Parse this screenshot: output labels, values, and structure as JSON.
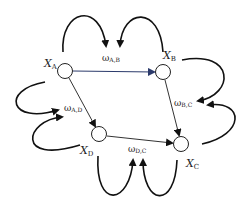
{
  "diagram": {
    "nodes": [
      {
        "id": "A",
        "label": "X",
        "sub": "A",
        "cx": 65,
        "cy": 71
      },
      {
        "id": "B",
        "label": "X",
        "sub": "B",
        "cx": 163,
        "cy": 72
      },
      {
        "id": "D",
        "label": "X",
        "sub": "D",
        "cx": 99,
        "cy": 134
      },
      {
        "id": "C",
        "label": "X",
        "sub": "C",
        "cx": 181,
        "cy": 144
      }
    ],
    "edges": [
      {
        "from": "A",
        "to": "B",
        "color": "#2b3a6b"
      },
      {
        "from": "A",
        "to": "D",
        "color": "#333333"
      },
      {
        "from": "B",
        "to": "C",
        "color": "#333333"
      },
      {
        "from": "D",
        "to": "C",
        "color": "#333333"
      }
    ],
    "weights": [
      {
        "id": "AB",
        "symbol": "ω",
        "sub": "A,B"
      },
      {
        "id": "BC",
        "symbol": "ω",
        "sub": "B,C"
      },
      {
        "id": "AD",
        "symbol": "ω",
        "sub": "A,D"
      },
      {
        "id": "DC",
        "symbol": "ω",
        "sub": "D,C"
      }
    ]
  }
}
